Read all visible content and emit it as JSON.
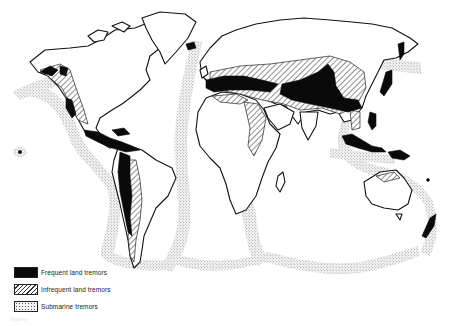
{
  "figure": {
    "caption": "Figure"
  },
  "legend": {
    "items": [
      {
        "key": "frequent",
        "label": "Frequent land tremors",
        "pattern": "solid-black"
      },
      {
        "key": "infrequent",
        "label": "Infrequent land tremors",
        "pattern": "diagonal-hatch"
      },
      {
        "key": "submarine",
        "label": "Submarine tremors",
        "pattern": "stipple"
      }
    ]
  },
  "colors": {
    "ink": "#0a0a0a",
    "paper": "#ffffff",
    "stipple": "#555555"
  },
  "regions": {
    "frequent": [
      "Alaska / Aleutians",
      "Western North America",
      "Central America & Caribbean",
      "Andes",
      "Mediterranean–Iran–Himalaya belt",
      "Japan",
      "Kamchatka",
      "Indonesia",
      "New Guinea",
      "New Zealand",
      "Iceland",
      "Hawaii"
    ],
    "infrequent": [
      "Western Cordillera",
      "Eastern Andes",
      "Southern Europe",
      "Central Asia",
      "East Africa Rift",
      "Arabia",
      "China",
      "Northern Australia"
    ],
    "submarine": [
      "Pacific Ring",
      "Mid-Atlantic Ridge",
      "Indian Ocean Ridges",
      "Southern Ocean Ridges"
    ]
  }
}
